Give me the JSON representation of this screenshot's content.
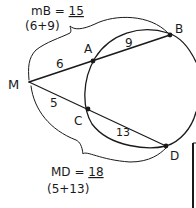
{
  "diagram": {
    "type": "secant-segments",
    "external_point": "M",
    "points": {
      "M": {
        "label": "M",
        "x": 29,
        "y": 82
      },
      "A": {
        "label": "A",
        "x": 93,
        "y": 61
      },
      "B": {
        "label": "B",
        "x": 170,
        "y": 35
      },
      "C": {
        "label": "C",
        "x": 88,
        "y": 109
      },
      "D": {
        "label": "D",
        "x": 166,
        "y": 146
      }
    },
    "segment_labels": {
      "MA": "6",
      "AB": "9",
      "MC": "5",
      "CD": "13"
    },
    "annotations": {
      "top_line1_prefix": "mB = ",
      "top_value": "15",
      "top_line2": "(6+9)",
      "bottom_line1_prefix": "MD = ",
      "bottom_value": "18",
      "bottom_line2": "(5+13)"
    }
  }
}
